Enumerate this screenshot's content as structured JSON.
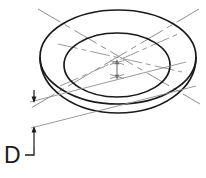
{
  "drawing": {
    "title": "Counterbore depth dimension isometric view",
    "background_color": "#ffffff",
    "line_color": "#1a1a1a",
    "centerline_color": "#8c8c8c",
    "dimension_color": "#1a1a1a",
    "labels": {
      "depth_label": "D"
    },
    "features": {
      "outer_ellipse": {
        "name": "outer-rim-ellipse",
        "cx": 118,
        "cy": 57,
        "rx": 78,
        "ry": 47
      },
      "inner_ellipse": {
        "name": "inner-bore-ellipse",
        "cx": 117,
        "cy": 65,
        "rx": 53,
        "ry": 32
      },
      "bottom_arc": {
        "name": "bowl-bottom-arc"
      },
      "centerlines": [
        {
          "name": "centerline-major-axis"
        },
        {
          "name": "centerline-minor-axis"
        }
      ],
      "depth_dimension": {
        "name": "depth-dimension",
        "label": "D",
        "arrow_top_y": 95,
        "arrow_bottom_y": 128
      },
      "center_dimension": {
        "name": "center-depth-arrow",
        "top_y": 60,
        "bottom_y": 79
      }
    }
  }
}
